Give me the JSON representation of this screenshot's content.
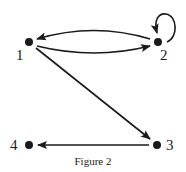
{
  "figure": {
    "caption": "Figure 2",
    "nodes": [
      {
        "id": "1",
        "label": "1"
      },
      {
        "id": "2",
        "label": "2"
      },
      {
        "id": "3",
        "label": "3"
      },
      {
        "id": "4",
        "label": "4"
      }
    ],
    "edges": [
      {
        "from": "2",
        "to": "1"
      },
      {
        "from": "1",
        "to": "2"
      },
      {
        "from": "2",
        "to": "2"
      },
      {
        "from": "1",
        "to": "3"
      },
      {
        "from": "3",
        "to": "4"
      }
    ],
    "colors": {
      "ink": "#1a1a1a",
      "background": "#ffffff"
    }
  }
}
